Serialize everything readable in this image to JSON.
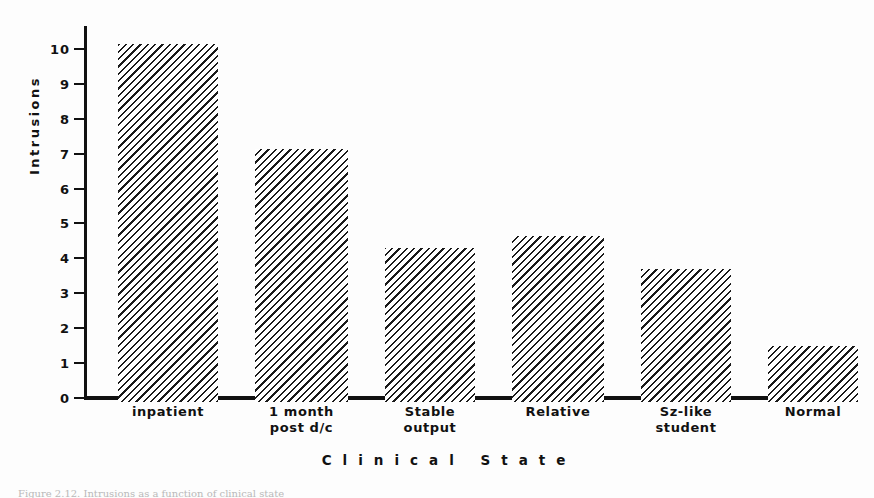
{
  "figure": {
    "background": "#fdfdfd",
    "ink_color": "#111111",
    "caption_partial": "Figure 2.12.  Intrusions as a function of clinical state"
  },
  "chart_data": {
    "type": "bar",
    "title": "",
    "xlabel": "Clinical State",
    "ylabel": "Intrusions",
    "categories": [
      "inpatient",
      "1 month\npost d/c",
      "Stable\noutput",
      "Relative",
      "Sz-like\nstudent",
      "Normal"
    ],
    "values": [
      10.25,
      7.25,
      4.4,
      4.75,
      3.8,
      1.6
    ],
    "ylim": [
      0,
      10.6
    ],
    "yticks": [
      0,
      1,
      2,
      3,
      4,
      5,
      6,
      7,
      8,
      9,
      10
    ],
    "ytick_labels": [
      "0",
      "1",
      "2",
      "3",
      "4",
      "5",
      "6",
      "7",
      "8",
      "9",
      "10"
    ],
    "grid": false,
    "legend": null,
    "bar_fill": "diagonal-hatch",
    "bar_fill_color": "#1a1a1a"
  }
}
